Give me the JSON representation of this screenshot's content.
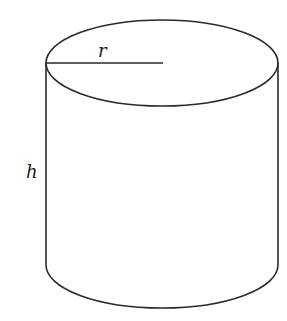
{
  "figure": {
    "type": "cylinder",
    "labels": {
      "radius": "r",
      "height": "h"
    },
    "colors": {
      "stroke": "#2a2a2a",
      "background": "#ffffff"
    }
  }
}
